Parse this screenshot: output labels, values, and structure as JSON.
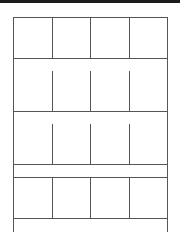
{
  "layout": {
    "rows": [
      {
        "cells": 4,
        "strip": true
      },
      {
        "cells": 4,
        "strip": true
      },
      {
        "cells": 4,
        "strip": true
      },
      {
        "cells": 4,
        "strip": true
      }
    ]
  },
  "colors": {
    "topbar": "#1c1c1c",
    "line": "#555555",
    "background": "#ffffff"
  }
}
